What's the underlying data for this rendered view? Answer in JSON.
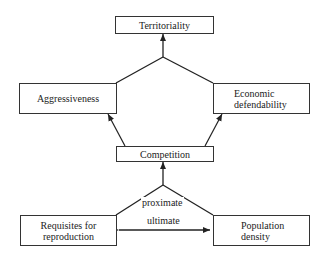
{
  "diagram": {
    "nodes": {
      "territoriality": "Territoriality",
      "aggressiveness": "Aggressiveness",
      "economic_defendability": "Economic defendability",
      "economic_line1": "Economic",
      "economic_line2": "defendability",
      "competition": "Competition",
      "requisites_line1": "Requisites for",
      "requisites_line2": "reproduction",
      "population_line1": "Population",
      "population_line2": "density"
    },
    "edge_labels": {
      "proximate": "proximate",
      "ultimate": "ultimate"
    },
    "edges": [
      {
        "from": [
          "Aggressiveness",
          "Economic defendability"
        ],
        "to": "Territoriality"
      },
      {
        "from": "Competition",
        "to": "Aggressiveness"
      },
      {
        "from": "Competition",
        "to": "Economic defendability"
      },
      {
        "from": [
          "Requisites for reproduction",
          "Population density"
        ],
        "to": "Competition",
        "label": "proximate"
      },
      {
        "from": "Requisites for reproduction",
        "to": "Population density",
        "label": "ultimate",
        "bidirectional": true
      }
    ]
  }
}
